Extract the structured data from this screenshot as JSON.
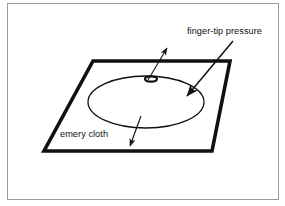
{
  "figure": {
    "background_color": "#ffffff",
    "frame_color": "#9a9a9a",
    "ink_color": "#111111",
    "labels": {
      "finger_tip_pressure": "finger-tip pressure",
      "emery_cloth": "emery cloth"
    },
    "shapes": {
      "sheet": {
        "name": "emery-cloth-sheet",
        "type": "parallelogram",
        "points": "93,61 230,61 212,151 44,151",
        "stroke_width": 3.6
      },
      "rub_circle": {
        "name": "rubbing-area-ellipse",
        "type": "ellipse",
        "cx": 146,
        "cy": 102,
        "rx": 58,
        "ry": 26,
        "stroke_width": 1.3
      },
      "contact_spot": {
        "name": "finger-contact-spot",
        "type": "ellipse",
        "cx": 151,
        "cy": 79,
        "rx": 6,
        "ry": 2.6,
        "stroke_width": 2.1
      }
    },
    "arrows": [
      {
        "name": "finger-tip-pressure-arrow",
        "from": [
          233,
          41
        ],
        "to": [
          185,
          98
        ],
        "points_to": "rubbing-area-ellipse",
        "head_size": 11
      },
      {
        "name": "contact-spot-callout-arrow",
        "from": [
          148,
          80
        ],
        "to": [
          168,
          46
        ],
        "points_to": "finger-contact-spot",
        "head_size": 7
      },
      {
        "name": "emery-cloth-callout-arrow",
        "from": [
          141,
          116
        ],
        "to": [
          129,
          148
        ],
        "points_to": "emery-cloth-sheet",
        "head_size": 7
      }
    ],
    "label_positions": {
      "finger_tip_pressure": {
        "x": 187,
        "y": 34
      },
      "emery_cloth": {
        "x": 60,
        "y": 137
      }
    }
  }
}
